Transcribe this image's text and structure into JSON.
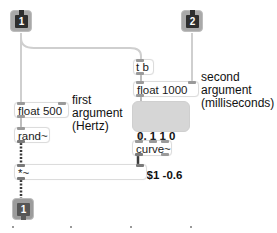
{
  "patch": {
    "inlets": [
      {
        "index": "1",
        "label": "1"
      },
      {
        "index": "2",
        "label": "2"
      }
    ],
    "outlets": [
      {
        "index": "1",
        "label": "1"
      }
    ],
    "objects": {
      "trigger": "t b",
      "float_freq": "float 500",
      "float_time": "float 1000",
      "rand": "rand~",
      "curve": "curve~",
      "multiply": "*~"
    },
    "message": {
      "line1": "0, 1 1 0",
      "line2": "0 $1 -0.6"
    },
    "comments": {
      "first_arg": "first\nargument\n(Hertz)",
      "second_arg": "second\nargument\n(milliseconds)"
    },
    "colors": {
      "control_cord": "#c8c8c8",
      "signal_cord": "#4a4a4a",
      "inlet_fill": "#2e2e2e",
      "message_fill": "#d6d6d6"
    }
  }
}
